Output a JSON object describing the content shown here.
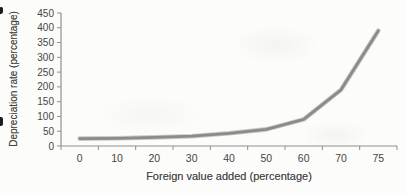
{
  "figure": {
    "background": "#fcfcfa",
    "kind": "scanned line chart"
  },
  "chart_data": {
    "type": "line",
    "title": "",
    "xlabel": "Foreign value added (percentage)",
    "ylabel": "Depreciation rate (percentage)",
    "categories": [
      "0",
      "10",
      "20",
      "30",
      "40",
      "50",
      "60",
      "70",
      "75"
    ],
    "values": [
      25,
      26,
      29,
      33,
      43,
      56,
      90,
      190,
      390
    ],
    "ylim": [
      0,
      450
    ],
    "ytick_step": 50,
    "grid": false,
    "legend": "none",
    "line_color": "#8b8b8b",
    "line_halo_color": "#c9c9c7",
    "axis_color": "#8f8f8f",
    "text_color": "#454545"
  }
}
